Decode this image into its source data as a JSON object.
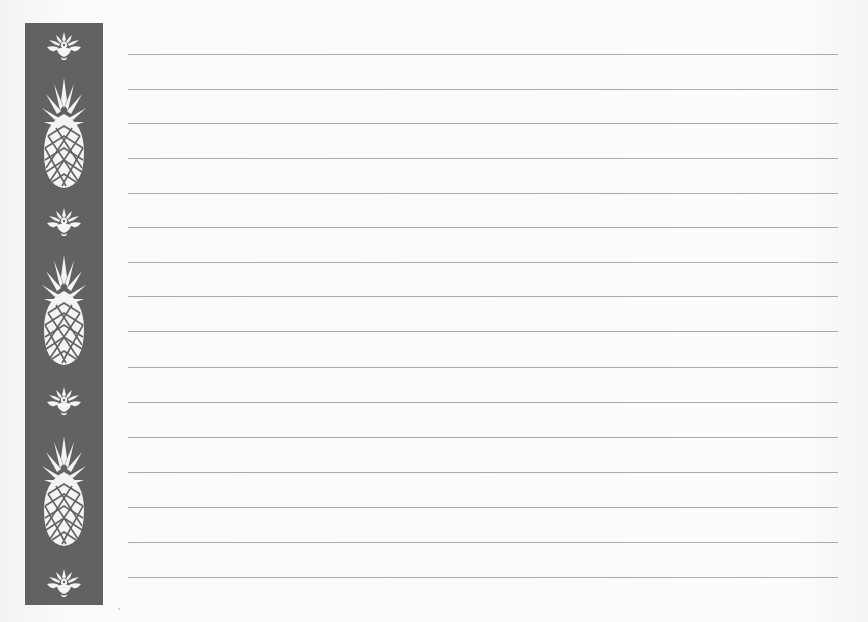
{
  "document": {
    "type": "lined stationery",
    "background_color": "#fcfcfc"
  },
  "sidebar": {
    "color": "#626262",
    "motif_color": "#f4f4f4",
    "motifs": [
      {
        "kind": "flourish",
        "top": 30
      },
      {
        "kind": "pineapple",
        "top": 78
      },
      {
        "kind": "flourish",
        "top": 206
      },
      {
        "kind": "pineapple",
        "top": 255
      },
      {
        "kind": "flourish",
        "top": 385
      },
      {
        "kind": "pineapple",
        "top": 436
      },
      {
        "kind": "flourish",
        "top": 567
      }
    ]
  },
  "ruled_lines": {
    "color": "#a9a9a9",
    "count": 16,
    "left": 128,
    "width": 710,
    "y_positions": [
      54,
      89,
      123,
      158,
      193,
      227,
      262,
      296,
      331,
      367,
      402,
      437,
      472,
      507,
      542,
      577
    ]
  }
}
